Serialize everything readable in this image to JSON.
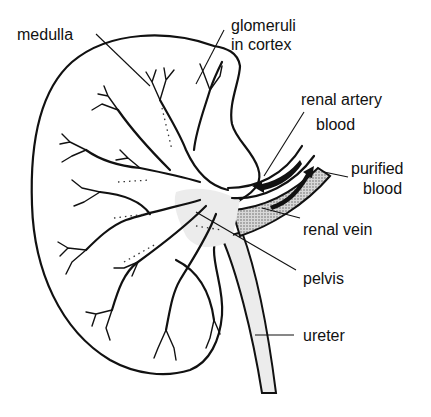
{
  "diagram": {
    "labels": {
      "medulla": "medulla",
      "glomeruli_line1": "glomeruli",
      "glomeruli_line2": "in cortex",
      "renal_artery_line1": "renal artery",
      "renal_artery_line2": "blood",
      "purified_line1": "purified",
      "purified_line2": "blood",
      "renal_vein": "renal vein",
      "pelvis": "pelvis",
      "ureter": "ureter"
    },
    "colors": {
      "ink": "#111111",
      "background": "#ffffff",
      "stipple": "#9a9a9a",
      "light_fill": "#ececec"
    }
  }
}
